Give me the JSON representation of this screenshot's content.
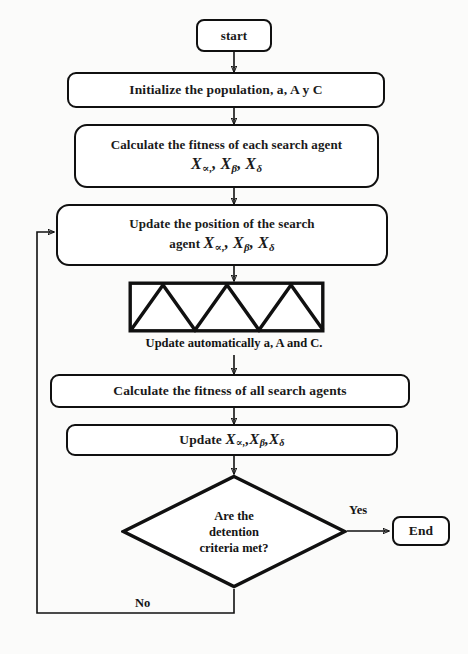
{
  "diagram": {
    "type": "flowchart",
    "background_color": "#fbfbfa",
    "line_color": "#111111",
    "text_color": "#141414"
  },
  "nodes": {
    "start": {
      "label": "start",
      "shape": "terminator"
    },
    "initialize": {
      "label": "Initialize  the population,  a, A y C",
      "shape": "process-rounded"
    },
    "calc_each": {
      "line1": "Calculate the fitness of each search agent",
      "math_x": "X",
      "sub_alpha": "∝,",
      "sub_beta": "β",
      "sub_delta": "δ",
      "shape": "process-rounded"
    },
    "update_position": {
      "line1": "Update the position  of the search",
      "line2_prefix": "agent ",
      "math_x": "X",
      "sub_alpha": "∝,",
      "sub_beta": "β",
      "sub_delta": "δ",
      "shape": "process-rounded"
    },
    "sawtooth": {
      "shape": "sawtooth-box",
      "teeth": 3,
      "caption": "Update automatically  a, A and C."
    },
    "calc_all": {
      "label": "Calculate the fitness of all search agents",
      "shape": "process-rounded"
    },
    "update_x": {
      "prefix": "Update ",
      "math_x": "X",
      "sub_alpha": "∝,",
      "sub_beta": "β",
      "sub_delta": "δ",
      "shape": "process-rounded"
    },
    "decision": {
      "line1": "Are the",
      "line2": "detention",
      "line3": "criteria met?",
      "shape": "diamond"
    },
    "end": {
      "label": "End",
      "shape": "terminator"
    }
  },
  "edges": {
    "yes_label": "Yes",
    "no_label": "No"
  },
  "separators": {
    "x_comma": ", ",
    "x_comma_tight": ","
  }
}
